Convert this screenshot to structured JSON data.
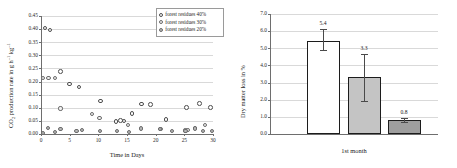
{
  "figure": {
    "background": "#ffffff",
    "panels": [
      "scatter-co2-production-rate",
      "bar-dry-matter-loss"
    ]
  },
  "chart_data": [
    {
      "type": "scatter",
      "id": "co2-production-rate",
      "title": "",
      "xlabel": "Time in Days",
      "ylabel": "CO2 production rate in g h-1 kg-1",
      "ylabel_html": "CO<sub>2</sub> production rate in g h<sup>-1</sup> kg<sup>-1</sup>",
      "xlim": [
        0,
        30
      ],
      "ylim": [
        0.0,
        0.45
      ],
      "xticks": [
        0,
        5,
        10,
        15,
        20,
        25,
        30
      ],
      "xtick_labels": [
        "0",
        "5",
        "10",
        "15",
        "20",
        "25",
        "30"
      ],
      "yticks": [
        0.0,
        0.05,
        0.1,
        0.15,
        0.2,
        0.25,
        0.3,
        0.35,
        0.4,
        0.45
      ],
      "ytick_labels": [
        "0.00",
        "0.05",
        "0.10",
        "0.15",
        "0.20",
        "0.25",
        "0.30",
        "0.35",
        "0.40",
        "0.45"
      ],
      "grid": true,
      "grid_axis": "y",
      "legend_position": "top-right",
      "series": [
        {
          "name": "forest residues 40%",
          "marker": "open-circle",
          "marker_fill": "#ffffff",
          "marker_edge": "#4d4d4d",
          "points": [
            [
              0.7,
              0.405
            ],
            [
              1.6,
              0.396
            ],
            [
              3.4,
              0.239
            ],
            [
              5.0,
              0.19
            ],
            [
              6.6,
              0.18
            ],
            [
              10.4,
              0.126
            ],
            [
              13.1,
              0.048
            ],
            [
              13.9,
              0.052
            ],
            [
              14.5,
              0.05
            ],
            [
              15.9,
              0.079
            ],
            [
              17.5,
              0.114
            ],
            [
              19.1,
              0.112
            ],
            [
              21.8,
              0.055
            ],
            [
              25.4,
              0.102
            ],
            [
              27.6,
              0.117
            ],
            [
              29.6,
              0.101
            ]
          ]
        },
        {
          "name": "forest residues 30%",
          "marker": "light-circle",
          "marker_fill": "#f2f2f2",
          "marker_edge": "#6b6b6b",
          "points": [
            [
              0.4,
              0.212
            ],
            [
              1.3,
              0.214
            ],
            [
              2.4,
              0.212
            ],
            [
              3.4,
              0.097
            ],
            [
              8.9,
              0.077
            ],
            [
              10.2,
              0.062
            ],
            [
              15.2,
              0.033
            ],
            [
              20.7,
              0.018
            ],
            [
              21.0,
              0.019
            ],
            [
              25.2,
              0.013
            ],
            [
              25.7,
              0.015
            ],
            [
              26.8,
              0.022
            ],
            [
              28.6,
              0.034
            ]
          ]
        },
        {
          "name": "forest residues 20%",
          "marker": "filled-circle",
          "marker_fill": "#b9b9b9",
          "marker_edge": "#6b6b6b",
          "points": [
            [
              0.3,
              0.004
            ],
            [
              1.2,
              0.024
            ],
            [
              2.4,
              0.007
            ],
            [
              3.4,
              0.018
            ],
            [
              6.2,
              0.01
            ],
            [
              7.2,
              0.014
            ],
            [
              10.3,
              0.011
            ],
            [
              13.2,
              0.01
            ],
            [
              15.4,
              0.009
            ],
            [
              17.4,
              0.021
            ],
            [
              20.8,
              0.019
            ],
            [
              22.9,
              0.01
            ],
            [
              25.2,
              0.012
            ],
            [
              26.9,
              0.021
            ],
            [
              28.3,
              0.01
            ],
            [
              29.8,
              0.012
            ]
          ]
        }
      ]
    },
    {
      "type": "bar",
      "id": "dry-matter-loss",
      "title": "",
      "xlabel": "1st month",
      "ylabel": "Dry matter loss in %",
      "categories": [
        "1st month"
      ],
      "ylim": [
        0.0,
        7.0
      ],
      "yticks": [
        0.0,
        1.0,
        2.0,
        3.0,
        4.0,
        5.0,
        6.0,
        7.0
      ],
      "ytick_labels": [
        "0.0",
        "1.0",
        "2.0",
        "3.0",
        "4.0",
        "5.0",
        "6.0",
        "7.0"
      ],
      "grid": true,
      "grid_axis": "y",
      "legend_position": "none",
      "bars": [
        {
          "label": "5.4",
          "value": 5.4,
          "err_low": 4.9,
          "err_high": 6.1,
          "fill": "#ffffff",
          "edge": "#1c1c1c"
        },
        {
          "label": "3.3",
          "value": 3.3,
          "err_low": 1.95,
          "err_high": 4.65,
          "fill": "#c4c4c4",
          "edge": "#1c1c1c"
        },
        {
          "label": "0.8",
          "value": 0.8,
          "err_low": 0.72,
          "err_high": 0.92,
          "fill": "#9e9e9e",
          "edge": "#1c1c1c"
        }
      ]
    }
  ]
}
